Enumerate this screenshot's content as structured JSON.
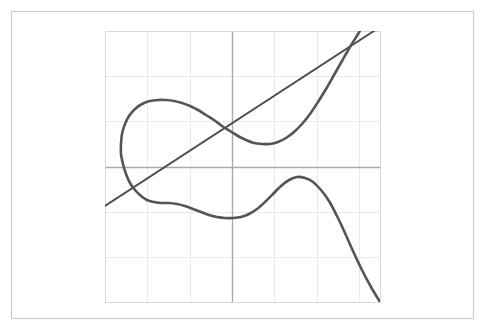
{
  "figure": {
    "background_color": "#ffffff",
    "outer_frame": {
      "x": 11,
      "y": 11,
      "width": 462,
      "height": 307,
      "stroke_color": "#cccccc",
      "stroke_width": 1.2
    }
  },
  "chart_data": {
    "type": "line",
    "title": "",
    "subtitle": "",
    "xlabel": "",
    "ylabel": "",
    "grid": true,
    "legend": false,
    "legend_position": "none",
    "xlim": [
      -3,
      3.5
    ],
    "ylim": [
      -3,
      3
    ],
    "xticks": [
      -3,
      -2,
      -1,
      0,
      1,
      2,
      3
    ],
    "yticks": [
      -3,
      -2,
      -1,
      0,
      1,
      2,
      3
    ],
    "xticklabels": [
      "",
      "",
      "",
      "",
      "",
      "",
      ""
    ],
    "yticklabels": [
      "",
      "",
      "",
      "",
      "",
      "",
      ""
    ],
    "axis_lines": {
      "x_axis_y": 0,
      "y_axis_x": 0,
      "color": "#aaaaaa",
      "width": 1.4
    },
    "grid_color": "#e8e8e8",
    "grid_width": 0.9,
    "plot_frame_color": "#d8d8d8",
    "plot_area_px": {
      "left": 105,
      "top": 31,
      "right": 380,
      "bottom": 302
    },
    "series": [
      {
        "name": "straight-line",
        "kind": "line",
        "color": "#4d4d4d",
        "width": 1.9,
        "points_px": [
          [
            105,
            206
          ],
          [
            380,
            27
          ]
        ],
        "description": "ascending straight line from lower-left to upper-right"
      },
      {
        "name": "looped-curve",
        "kind": "parametric-curve",
        "color": "#555555",
        "width": 2.6,
        "points_px": [
          [
            380,
            302
          ],
          [
            371,
            287
          ],
          [
            362,
            270
          ],
          [
            353,
            251
          ],
          [
            345,
            233
          ],
          [
            337,
            216
          ],
          [
            329,
            201
          ],
          [
            321,
            190
          ],
          [
            313,
            182
          ],
          [
            305,
            178
          ],
          [
            297,
            177
          ],
          [
            289,
            180
          ],
          [
            281,
            186
          ],
          [
            273,
            194
          ],
          [
            265,
            202
          ],
          [
            257,
            209
          ],
          [
            249,
            214
          ],
          [
            241,
            217
          ],
          [
            233,
            218
          ],
          [
            225,
            218
          ],
          [
            217,
            217
          ],
          [
            209,
            215
          ],
          [
            201,
            212
          ],
          [
            193,
            209
          ],
          [
            185,
            206
          ],
          [
            177,
            204
          ],
          [
            169,
            203
          ],
          [
            161,
            203
          ],
          [
            154,
            202
          ],
          [
            147,
            200
          ],
          [
            141,
            196
          ],
          [
            135,
            190
          ],
          [
            130,
            183
          ],
          [
            126,
            174
          ],
          [
            123,
            164
          ],
          [
            121,
            154
          ],
          [
            121,
            144
          ],
          [
            122,
            134
          ],
          [
            125,
            124
          ],
          [
            129,
            116
          ],
          [
            135,
            109
          ],
          [
            142,
            104
          ],
          [
            150,
            101
          ],
          [
            158,
            100
          ],
          [
            166,
            100
          ],
          [
            174,
            101
          ],
          [
            182,
            103
          ],
          [
            190,
            106
          ],
          [
            198,
            110
          ],
          [
            206,
            115
          ],
          [
            214,
            120
          ],
          [
            222,
            126
          ],
          [
            230,
            131
          ],
          [
            238,
            136
          ],
          [
            246,
            140
          ],
          [
            254,
            143
          ],
          [
            262,
            144
          ],
          [
            270,
            144
          ],
          [
            278,
            142
          ],
          [
            286,
            138
          ],
          [
            294,
            132
          ],
          [
            302,
            124
          ],
          [
            310,
            114
          ],
          [
            318,
            102
          ],
          [
            326,
            89
          ],
          [
            334,
            75
          ],
          [
            342,
            61
          ],
          [
            350,
            47
          ],
          [
            358,
            34
          ],
          [
            364,
            24
          ]
        ],
        "description": "continuous curve with left-side closed loop, descending to bottom-right"
      }
    ]
  }
}
